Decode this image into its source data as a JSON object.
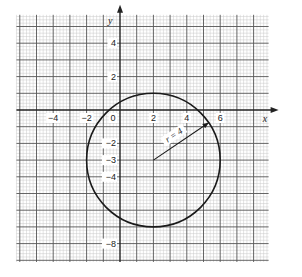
{
  "chart_data": {
    "type": "line",
    "title": "",
    "xlabel": "x",
    "ylabel": "y",
    "xlim": [
      -6.2,
      8.9
    ],
    "ylim": [
      -9.1,
      5.7
    ],
    "grid": true,
    "grid_major_step": 1,
    "grid_minor_step": 0.2,
    "x_ticks": [
      {
        "value": -4,
        "label": "−4"
      },
      {
        "value": -2,
        "label": "−2"
      },
      {
        "value": 0,
        "label": "0"
      },
      {
        "value": 2,
        "label": "2"
      },
      {
        "value": 4,
        "label": "4"
      },
      {
        "value": 6,
        "label": "6"
      }
    ],
    "y_ticks": [
      {
        "value": 4,
        "label": "4"
      },
      {
        "value": 2,
        "label": "2"
      },
      {
        "value": -2,
        "label": "−2"
      },
      {
        "value": -3,
        "label": "−3"
      },
      {
        "value": -4,
        "label": "−4"
      },
      {
        "value": -8,
        "label": "−8"
      }
    ],
    "series": [
      {
        "name": "circle",
        "shape": "circle",
        "center": [
          2,
          -3
        ],
        "radius": 4,
        "color": "#1a1a1a"
      }
    ],
    "annotations": [
      {
        "type": "arrow",
        "from": [
          2,
          -3
        ],
        "to": [
          5.31,
          -0.76
        ],
        "label": "r = 4"
      }
    ],
    "colors": {
      "minor_grid": "#c8c8c8",
      "major_grid": "#555555",
      "axis": "#222222",
      "curve": "#1a1a1a"
    }
  }
}
